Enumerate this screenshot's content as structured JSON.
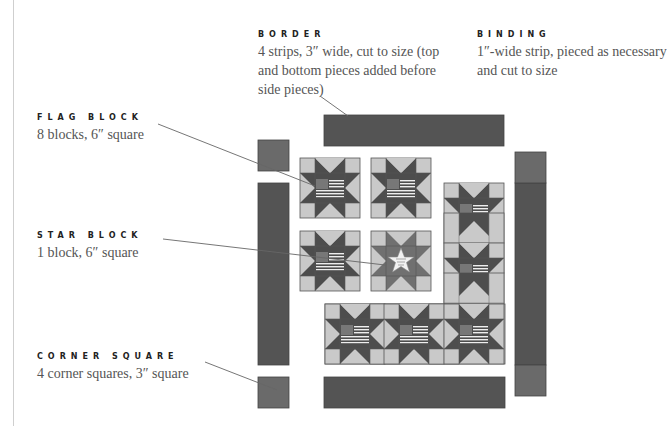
{
  "labels": {
    "border": {
      "title": "BORDER",
      "desc": [
        "4 strips, 3″ wide, cut to size (top",
        "and bottom pieces added before",
        "side pieces)"
      ]
    },
    "binding": {
      "title": "BINDING",
      "desc": [
        "1″-wide strip, pieced as necessary",
        "and cut to size"
      ]
    },
    "flag_block": {
      "title": "FLAG BLOCK",
      "desc": [
        "8 blocks, 6″ square"
      ]
    },
    "star_block": {
      "title": "STAR BLOCK",
      "desc": [
        "1 block, 6″ square"
      ]
    },
    "corner_square": {
      "title": "CORNER SQUARE",
      "desc": [
        "4 corner squares, 3″ square"
      ]
    }
  },
  "colors": {
    "light": "#c9c9c9",
    "mid": "#707070",
    "dark": "#4d4d4d",
    "border_strip": "#545454",
    "corner": "#6a6a6a",
    "outline": "#555555",
    "leader": "#666666"
  }
}
